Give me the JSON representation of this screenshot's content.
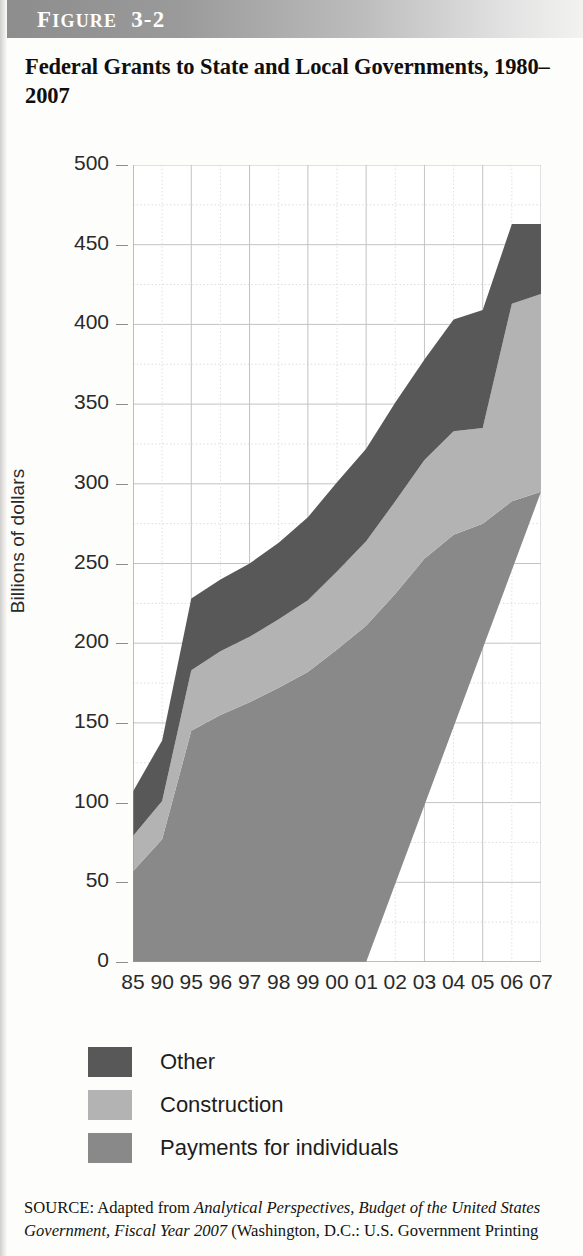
{
  "figure": {
    "banner_prefix": "F",
    "banner_text": "IGURE",
    "banner_number": "3-2",
    "title": "Federal Grants to State and Local Governments, 1980–2007"
  },
  "legend": {
    "items": [
      {
        "label": "Other",
        "color": "#585858",
        "name": "other"
      },
      {
        "label": "Construction",
        "color": "#b3b3b3",
        "name": "construction"
      },
      {
        "label": "Payments for individuals",
        "color": "#898989",
        "name": "payments-for-individuals"
      }
    ]
  },
  "source": {
    "prefix": "SOURCE: Adapted from ",
    "italic_1": "Analytical Perspectives, Budget of the United States Government, Fiscal Year 2007",
    "suffix": " (Washington, D.C.: U.S. Government Printing"
  },
  "chart_data": {
    "type": "area",
    "stacked": true,
    "title": "Federal Grants to State and Local Governments, 1980–2007",
    "xlabel": "",
    "ylabel": "Billions of dollars",
    "ylim": [
      0,
      500
    ],
    "ytick_values": [
      0,
      50,
      100,
      150,
      200,
      250,
      300,
      350,
      400,
      450,
      500
    ],
    "ytick_labels": [
      "0",
      "50",
      "100",
      "150",
      "200",
      "250",
      "300",
      "350",
      "400",
      "450",
      "500"
    ],
    "yminor_step": 25,
    "grid": true,
    "legend_position": "below",
    "categories": [
      "85",
      "90",
      "95",
      "96",
      "97",
      "98",
      "99",
      "00",
      "01",
      "02",
      "03",
      "04",
      "05",
      "06",
      "07"
    ],
    "series": [
      {
        "name": "Payments for individuals",
        "color": "#898989",
        "values": [
          57,
          77,
          145,
          155,
          163,
          172,
          182,
          196,
          211,
          231,
          253,
          268,
          275,
          289,
          295
        ]
      },
      {
        "name": "Construction",
        "color": "#b3b3b3",
        "values": [
          22,
          24,
          38,
          40,
          41,
          43,
          45,
          49,
          53,
          58,
          62,
          65,
          60,
          124,
          124
        ]
      },
      {
        "name": "Other",
        "color": "#585858",
        "values": [
          28,
          38,
          45,
          45,
          46,
          48,
          52,
          56,
          58,
          62,
          63,
          70,
          74,
          50,
          44
        ]
      }
    ],
    "totals": [
      107,
      139,
      228,
      240,
      250,
      263,
      279,
      301,
      322,
      351,
      378,
      403,
      409,
      463,
      463
    ]
  }
}
